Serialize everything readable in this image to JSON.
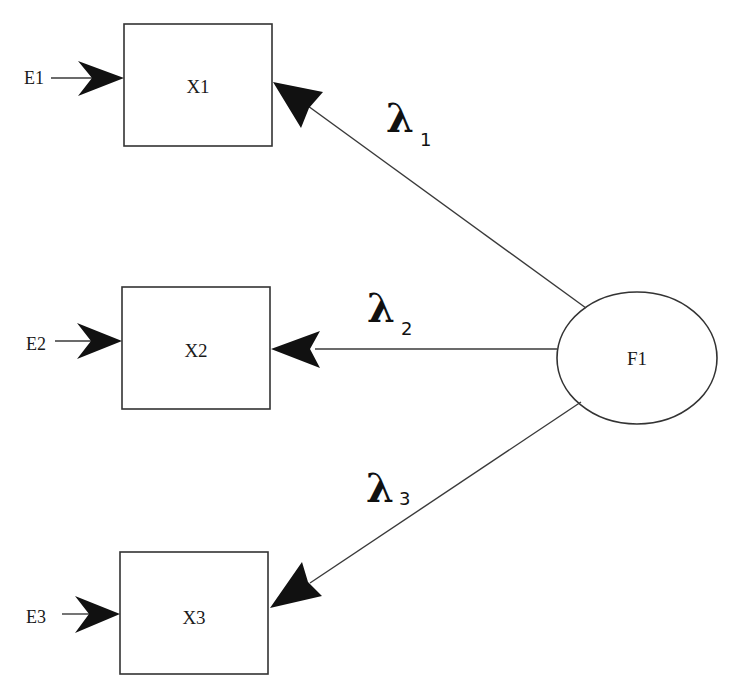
{
  "diagram": {
    "type": "confirmatory factor analysis path diagram",
    "latent_factor": {
      "id": "F1",
      "label": "F1"
    },
    "observed": [
      {
        "id": "X1",
        "label": "X1",
        "error": "E1",
        "loading": {
          "symbol": "λ",
          "subscript": "1"
        }
      },
      {
        "id": "X2",
        "label": "X2",
        "error": "E2",
        "loading": {
          "symbol": "λ",
          "subscript": "2"
        }
      },
      {
        "id": "X3",
        "label": "X3",
        "error": "E3",
        "loading": {
          "symbol": "λ",
          "subscript": "3"
        }
      }
    ],
    "edges": [
      {
        "from": "E1",
        "to": "X1"
      },
      {
        "from": "E2",
        "to": "X2"
      },
      {
        "from": "E3",
        "to": "X3"
      },
      {
        "from": "F1",
        "to": "X1",
        "label": "λ1"
      },
      {
        "from": "F1",
        "to": "X2",
        "label": "λ2"
      },
      {
        "from": "F1",
        "to": "X3",
        "label": "λ3"
      }
    ],
    "colors": {
      "stroke": "#333333",
      "arrowhead": "#111111",
      "background": "#ffffff"
    }
  }
}
